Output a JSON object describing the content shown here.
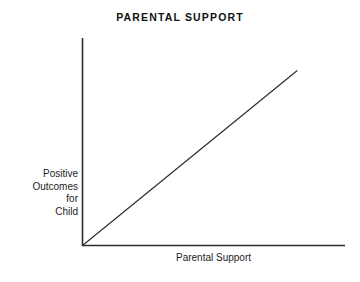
{
  "figure": {
    "background_color": "#ffffff",
    "ink_color": "#2b2b2b",
    "title": "PARENTAL SUPPORT"
  },
  "axes": {
    "y_label_lines": [
      "Positive",
      "Outcomes",
      "for",
      "Child"
    ],
    "y_label_text": "Positive Outcomes for Child",
    "x_label": "Parental Support"
  },
  "chart_data": {
    "type": "line",
    "title": "PARENTAL SUPPORT",
    "subtitle": "",
    "xlabel": "Parental Support",
    "ylabel": "Positive Outcomes for Child",
    "xlim": [
      0,
      100
    ],
    "ylim": [
      0,
      100
    ],
    "grid": false,
    "legend": false,
    "legend_position": "none",
    "axis_ticks": false,
    "tick_labels_x": [],
    "tick_labels_y": [],
    "annotations": [],
    "series": [
      {
        "name": "Positive Outcomes for Child",
        "x": [
          0,
          100
        ],
        "values": [
          0,
          84
        ],
        "style": "solid",
        "color": "#2b2b2b",
        "description": "Straight positively-sloped line rising from the origin, indicating that greater parental support is associated with more positive outcomes for the child."
      }
    ]
  }
}
